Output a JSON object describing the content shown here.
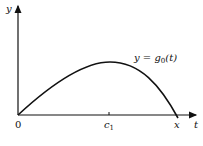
{
  "figure": {
    "y_axis_label": "y",
    "x_axis_label": "t",
    "origin_label": "0",
    "peak_label": "c",
    "peak_label_sub": "1",
    "root_label": "x",
    "curve_label_prefix": "y = g",
    "curve_label_sub": "0",
    "curve_label_suffix": "(t)"
  },
  "colors": {
    "stroke": "#111111",
    "background": "#ffffff"
  }
}
